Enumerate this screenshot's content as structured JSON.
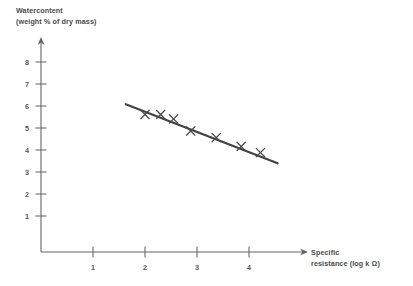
{
  "chart_data": {
    "type": "scatter",
    "title": "",
    "ylabel": "Watercontent\n(weight % of dry mass)",
    "ylabel_line1": "Watercontent",
    "ylabel_line2": "(weight % of dry mass)",
    "xlabel": "Specific\nresistance (log k Ω)",
    "xlabel_line1": "Specific",
    "xlabel_line2": "resistance (log k Ω)",
    "xlim": [
      0,
      5.1
    ],
    "ylim": [
      0,
      8.8
    ],
    "xticks": [
      1,
      2,
      3,
      4
    ],
    "yticks": [
      1,
      2,
      3,
      4,
      5,
      6,
      7,
      8
    ],
    "xtick_labels": [
      "1",
      "2",
      "3",
      "4"
    ],
    "ytick_labels": [
      "1",
      "2",
      "3",
      "4",
      "5",
      "6",
      "7",
      "8"
    ],
    "grid": false,
    "legend": null,
    "marker_style": "x",
    "series": [
      {
        "name": "measurements",
        "x": [
          2.0,
          2.3,
          2.55,
          2.88,
          3.37,
          3.85,
          4.22
        ],
        "y": [
          6.25,
          6.25,
          6.05,
          5.5,
          5.2,
          4.8,
          4.52
        ]
      }
    ],
    "trend_line": {
      "name": "fitted regression line",
      "x": [
        1.63,
        4.55
      ],
      "y": [
        6.72,
        4.03
      ],
      "slope": -0.92,
      "intercept": 8.22
    },
    "colors": {
      "ink": "#3d3d3d",
      "axis": "#5a5a5a",
      "trend": "#333333",
      "background": "#ffffff"
    }
  }
}
